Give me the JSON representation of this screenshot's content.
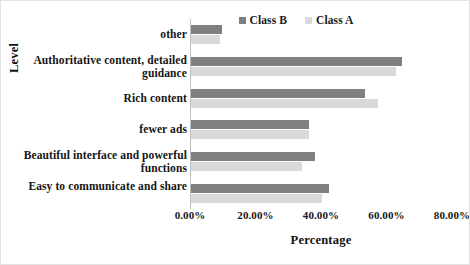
{
  "chart_data": {
    "type": "bar",
    "orientation": "horizontal",
    "title": "",
    "xlabel": "Percentage",
    "ylabel": "Level",
    "xlim": [
      0,
      80
    ],
    "xticks": [
      "0.00%",
      "20.00%",
      "40.00%",
      "60.00%",
      "80.00%"
    ],
    "xtick_values": [
      0,
      20,
      40,
      60,
      80
    ],
    "grid": false,
    "legend_position": "top-right",
    "categories": [
      "other",
      "Authoritative content, detailed guidance",
      "Rich content",
      "fewer ads",
      "Beautiful interface and powerful functions",
      "Easy to communicate and share"
    ],
    "series": [
      {
        "name": "Class B",
        "color": "#808080",
        "values": [
          9.5,
          64.5,
          53.0,
          36.0,
          38.0,
          42.0
        ]
      },
      {
        "name": "Class A",
        "color": "#d9d9d9",
        "values": [
          9.0,
          62.5,
          57.0,
          36.0,
          34.0,
          40.0
        ]
      }
    ]
  },
  "legend": {
    "entries": [
      {
        "label": "Class B",
        "swatch_name": "legend-swatch-class-b"
      },
      {
        "label": "Class A",
        "swatch_name": "legend-swatch-class-a"
      }
    ]
  },
  "axes": {
    "x_title": "Percentage",
    "y_title": "Level"
  },
  "colors": {
    "class_b": "#808080",
    "class_a": "#d9d9d9",
    "axis": "#bfbfbf",
    "frame": "#e2e2e2",
    "text": "#151515"
  }
}
